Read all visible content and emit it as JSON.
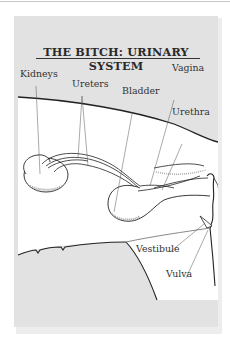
{
  "title": "THE BITCH: URINARY SYSTEM",
  "labels": {
    "kidneys": "Kidneys",
    "ureters": "Ureters",
    "bladder": "Bladder",
    "vagina": "Vagina",
    "urethra": "Urethra",
    "vestibule": "Vestibule",
    "vulva": "Vulva"
  },
  "colors": {
    "panel": "#e2e2e2",
    "body_fill": "#ffffff",
    "outline": "#222222",
    "leader": "#555555"
  }
}
